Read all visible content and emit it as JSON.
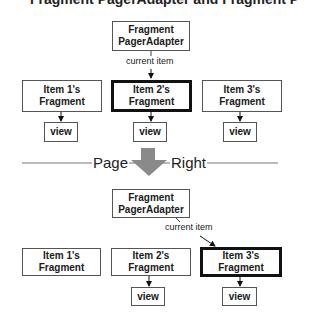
{
  "header": {
    "cut_title": "Fragment PagerAdapter and Fragment Pages"
  },
  "before": {
    "adapter": {
      "line1": "Fragment",
      "line2": "PagerAdapter"
    },
    "current_item_label": "current item",
    "items": [
      {
        "line1": "Item 1's",
        "line2": "Fragment",
        "view": "view",
        "current": false
      },
      {
        "line1": "Item 2's",
        "line2": "Fragment",
        "view": "view",
        "current": true
      },
      {
        "line1": "Item 3's",
        "line2": "Fragment",
        "view": "view",
        "current": false
      }
    ]
  },
  "transition": {
    "left": "Page",
    "right": "Right",
    "arrow_color": "#8a8a8a"
  },
  "after": {
    "adapter": {
      "line1": "Fragment",
      "line2": "PagerAdapter"
    },
    "current_item_label": "current item",
    "items": [
      {
        "line1": "Item 1's",
        "line2": "Fragment",
        "current": false
      },
      {
        "line1": "Item 2's",
        "line2": "Fragment",
        "view": "view",
        "current": false
      },
      {
        "line1": "Item 3's",
        "line2": "Fragment",
        "view": "view",
        "current": true
      }
    ]
  }
}
